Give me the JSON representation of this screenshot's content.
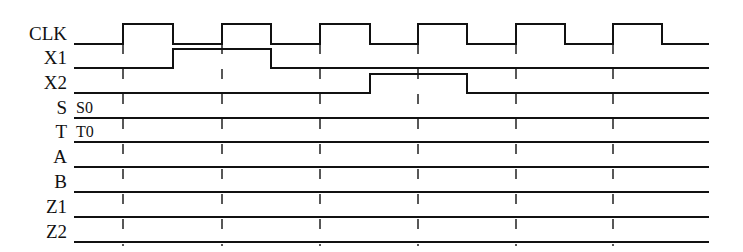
{
  "diagram": {
    "type": "timing-diagram",
    "signals": [
      {
        "name": "CLK",
        "kind": "clock"
      },
      {
        "name": "X1",
        "kind": "input"
      },
      {
        "name": "X2",
        "kind": "input"
      },
      {
        "name": "S",
        "kind": "state",
        "initial_value": "S0"
      },
      {
        "name": "T",
        "kind": "state",
        "initial_value": "T0"
      },
      {
        "name": "A",
        "kind": "output"
      },
      {
        "name": "B",
        "kind": "output"
      },
      {
        "name": "Z1",
        "kind": "output"
      },
      {
        "name": "Z2",
        "kind": "output"
      }
    ],
    "clock_cycles": 6,
    "clock_rising_edges_px": [
      123,
      222,
      320,
      418,
      516,
      613
    ],
    "clock_falling_edges_px": [
      173,
      271,
      370,
      467,
      565,
      662
    ],
    "waveforms": {
      "X1": {
        "high_from_px": 173,
        "high_to_px": 271,
        "description": "high from fall of clock 1 to fall of clock 2"
      },
      "X2": {
        "high_from_px": 370,
        "high_to_px": 467,
        "description": "high from fall of clock 3 to fall of clock 4"
      }
    },
    "state_labels": {
      "S": "S0",
      "T": "T0"
    },
    "colors": {
      "line": "#111111",
      "background": "#ffffff"
    }
  }
}
